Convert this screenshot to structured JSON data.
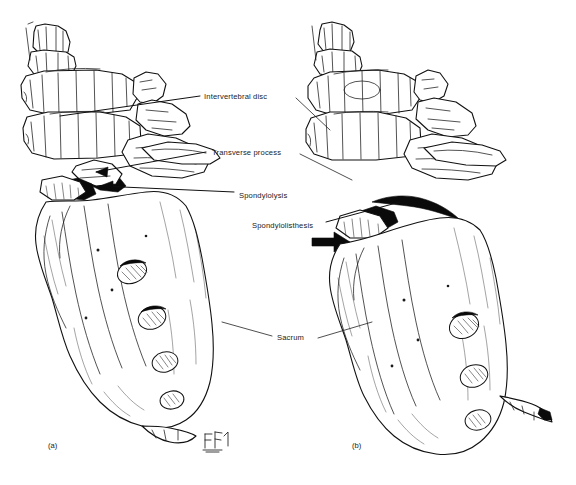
{
  "figure": {
    "type": "anatomical-line-illustration",
    "background_color": "#ffffff",
    "ink_color": "#111111",
    "label_color": "#1b1b1b"
  },
  "labels": {
    "intervertebral_disc": "Intervertebral disc",
    "transverse_process": "Transverse process",
    "spondylolysis": "Spondylolysis",
    "spondylolisthesis": "Spondylolisthesis",
    "sacrum": "Sacrum"
  },
  "panels": [
    {
      "id": "a",
      "caption": "(a)",
      "description": "Lateral view of lumbosacral spine showing spondylolysis: a defect in the pars interarticularis without vertebral displacement.",
      "features": [
        "lumbar vertebral bodies",
        "intervertebral disc space",
        "transverse process",
        "pars interarticularis defect",
        "sacrum",
        "sacral foramina"
      ]
    },
    {
      "id": "b",
      "caption": "(b)",
      "description": "Lateral view showing spondylolisthesis: forward slippage of the vertebral body, marked by a solid arrow.",
      "features": [
        "lumbar vertebral bodies",
        "displaced vertebra",
        "pars defect",
        "slip arrow",
        "sacrum",
        "sacral foramina"
      ]
    }
  ],
  "annotations": {
    "slip_arrow": {
      "name": "spondylolisthesis-arrow",
      "direction": "right",
      "color": "#0a0a0a",
      "points_at": "anterior slip of vertebral body in panel (b)"
    },
    "signature": {
      "name": "artist-signature-monogram",
      "panel": "a",
      "text": ""
    }
  }
}
